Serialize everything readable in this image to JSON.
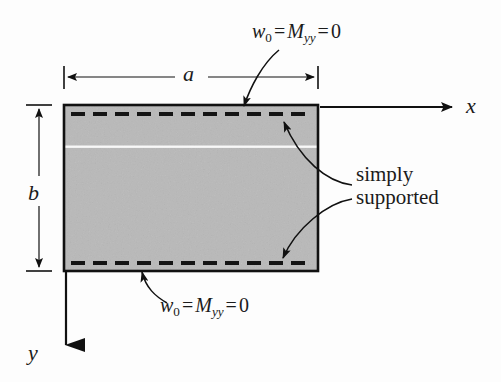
{
  "figure": {
    "type": "engineering-diagram",
    "plate": {
      "fill_color": "#b9b9b9",
      "border_color": "#111111",
      "width_label": "a",
      "height_label": "b"
    },
    "axes": {
      "x_label": "x",
      "y_label": "y",
      "origin": "top-left corner of plate",
      "x_direction": "rightward",
      "y_direction": "downward"
    },
    "boundary_conditions": {
      "top_edge": {
        "w_symbol": "w",
        "w_subscript": "0",
        "equals_1": "=",
        "moment_symbol": "M",
        "moment_subscript": "yy",
        "equals_2": "=",
        "value": "0"
      },
      "bottom_edge": {
        "w_symbol": "w",
        "w_subscript": "0",
        "equals_1": "=",
        "moment_symbol": "M",
        "moment_subscript": "yy",
        "equals_2": "=",
        "value": "0"
      }
    },
    "annotation": {
      "line1": "simply",
      "line2": "supported"
    },
    "dashed_edges": {
      "count": 2,
      "style": "dashed",
      "color": "#111111",
      "description": "dashed lines just inside top and bottom edges marking simply supported boundaries"
    }
  }
}
